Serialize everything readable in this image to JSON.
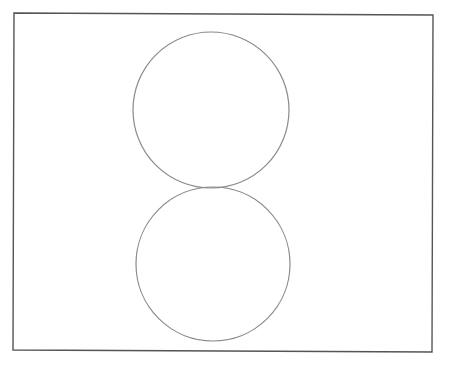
{
  "document": {
    "kind": "line-drawing",
    "title": "Two tangent circles in a rectangular frame",
    "background_color": "#ffffff",
    "width": 451,
    "height": 366,
    "visible_text": []
  },
  "figure": {
    "frame": {
      "name": "rectangular-border",
      "stroke_color": "#555555",
      "stroke_width": 1.4,
      "fill": "none",
      "points": "14,13 433,15 432,352 13,350",
      "corners": {
        "top_left": [
          14,
          13
        ],
        "top_right": [
          433,
          15
        ],
        "bottom_right": [
          432,
          352
        ],
        "bottom_left": [
          13,
          350
        ]
      }
    },
    "shapes": [
      {
        "name": "upper-circle",
        "type": "circle",
        "cx": 211,
        "cy": 110,
        "r": 78,
        "stroke_color": "#8a8a8a",
        "stroke_width": 1.2,
        "fill": "none"
      },
      {
        "name": "lower-circle",
        "type": "circle",
        "cx": 213,
        "cy": 264,
        "r": 77,
        "stroke_color": "#8a8a8a",
        "stroke_width": 1.2,
        "fill": "none"
      }
    ],
    "tangent_point": {
      "name": "circle-tangency-point",
      "x": 212,
      "y": 188
    }
  }
}
